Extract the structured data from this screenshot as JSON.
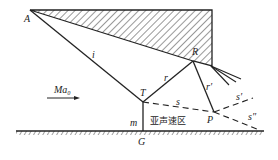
{
  "labels": {
    "A": "A",
    "i": "i",
    "R": "R",
    "r": "r",
    "r_prime": "r′",
    "T": "T",
    "s": "s",
    "s_prime": "s′",
    "s_double_prime": "s″",
    "P": "P",
    "m": "m",
    "G": "G",
    "mach": "Ma₀",
    "subsonic_region": "亚声速区"
  },
  "colors": {
    "line": "#222222",
    "background": "#ffffff"
  }
}
